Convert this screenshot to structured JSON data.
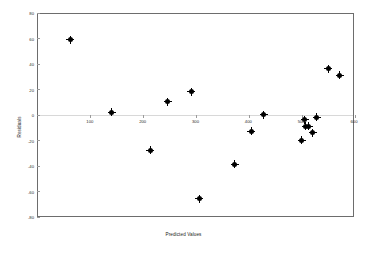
{
  "chart_data": {
    "type": "scatter",
    "title": "",
    "xlabel": "Predicted Values",
    "ylabel": "Residuals",
    "xlim": [
      0,
      600
    ],
    "ylim": [
      -80,
      80
    ],
    "xticks": [
      100,
      200,
      300,
      400,
      500,
      600
    ],
    "yticks": [
      80,
      60,
      40,
      20,
      0,
      -20,
      -40,
      -60,
      -80
    ],
    "xtick_labels": [
      "100",
      "200",
      "300",
      "400",
      "500",
      "600"
    ],
    "ytick_labels": [
      "80",
      "60",
      "40",
      "20",
      "0",
      "-20",
      "-40",
      "-60",
      "-80"
    ],
    "grid": false,
    "legend": false,
    "zero_line": true,
    "marker": "filled-circle-with-cross",
    "marker_color": "#000000",
    "frame_color": "#6d6d6d",
    "background": "#ffffff",
    "points": [
      {
        "x": 61,
        "y": 60
      },
      {
        "x": 140,
        "y": 3
      },
      {
        "x": 212,
        "y": -27
      },
      {
        "x": 246,
        "y": 11
      },
      {
        "x": 290,
        "y": 19
      },
      {
        "x": 305,
        "y": -65
      },
      {
        "x": 372,
        "y": -38
      },
      {
        "x": 427,
        "y": 1
      },
      {
        "x": 404,
        "y": -12
      },
      {
        "x": 505,
        "y": -3
      },
      {
        "x": 507,
        "y": -8
      },
      {
        "x": 512,
        "y": -8
      },
      {
        "x": 499,
        "y": -19
      },
      {
        "x": 520,
        "y": -13
      },
      {
        "x": 528,
        "y": -1
      },
      {
        "x": 549,
        "y": 37
      },
      {
        "x": 571,
        "y": 32
      }
    ]
  },
  "axes": {
    "x_title": "Predicted Values",
    "y_title": "Residuals"
  }
}
